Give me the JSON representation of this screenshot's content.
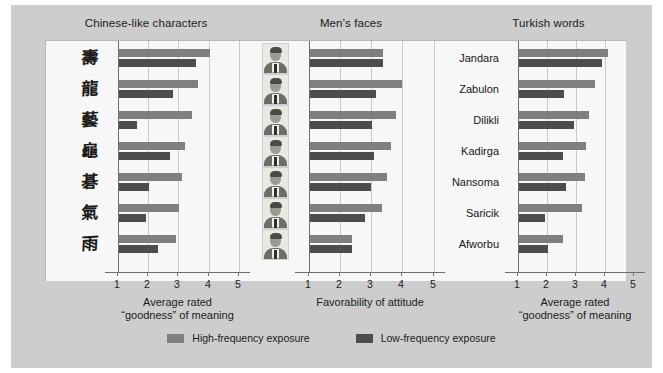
{
  "figure": {
    "background_color": "#cdcdcd",
    "plot_background_color": "#f7f7f7",
    "series_colors": {
      "high_frequency": "#7f7f7f",
      "low_frequency": "#4d4d4d"
    }
  },
  "legend": {
    "items": [
      {
        "label": "High-frequency exposure",
        "color": "#7f7f7f",
        "key": "hi"
      },
      {
        "label": "Low-frequency exposure",
        "color": "#4d4d4d",
        "key": "lo"
      }
    ]
  },
  "chart_data": [
    {
      "type": "bar",
      "orientation": "horizontal",
      "title": "Chinese-like characters",
      "xlabel": "Average rated\n“goodness” of meaning",
      "ylabel": "",
      "xlim": [
        0.6,
        5.4
      ],
      "ticks": [
        1,
        2,
        3,
        4,
        5
      ],
      "tick_labels": [
        "1",
        "2",
        "3",
        "4",
        "5"
      ],
      "grid": true,
      "categories": [
        "char-1",
        "char-2",
        "char-3",
        "char-4",
        "char-5",
        "char-6",
        "char-7"
      ],
      "category_glyphs": [
        "壽",
        "龍",
        "藝",
        "龜",
        "碁",
        "氣",
        "雨"
      ],
      "series": [
        {
          "name": "High-frequency exposure",
          "key": "hi",
          "values": [
            4.0,
            3.6,
            3.4,
            3.2,
            3.1,
            3.0,
            2.9
          ]
        },
        {
          "name": "Low-frequency exposure",
          "key": "lo",
          "values": [
            3.55,
            2.8,
            1.6,
            2.7,
            2.0,
            1.9,
            2.3
          ]
        }
      ]
    },
    {
      "type": "bar",
      "orientation": "horizontal",
      "title": "Men’s faces",
      "xlabel": "Favorability of attitude",
      "ylabel": "",
      "xlim": [
        0.6,
        5.4
      ],
      "ticks": [
        1,
        2,
        3,
        4,
        5
      ],
      "tick_labels": [
        "1",
        "2",
        "3",
        "4",
        "5"
      ],
      "grid": true,
      "categories": [
        "face-1",
        "face-2",
        "face-3",
        "face-4",
        "face-5",
        "face-6",
        "face-7"
      ],
      "series": [
        {
          "name": "High-frequency exposure",
          "key": "hi",
          "values": [
            3.35,
            3.95,
            3.75,
            3.6,
            3.45,
            3.3,
            2.35
          ]
        },
        {
          "name": "Low-frequency exposure",
          "key": "lo",
          "values": [
            3.35,
            3.1,
            3.0,
            3.05,
            2.95,
            2.75,
            2.35
          ]
        }
      ]
    },
    {
      "type": "bar",
      "orientation": "horizontal",
      "title": "Turkish words",
      "xlabel": "Average rated\n“goodness” of meaning",
      "ylabel": "",
      "xlim": [
        0.6,
        5.4
      ],
      "ticks": [
        1,
        2,
        3,
        4,
        5
      ],
      "tick_labels": [
        "1",
        "2",
        "3",
        "4",
        "5"
      ],
      "grid": true,
      "categories": [
        "Jandara",
        "Zabulon",
        "Dilikli",
        "Kadirga",
        "Nansoma",
        "Saricik",
        "Afworbu"
      ],
      "series": [
        {
          "name": "High-frequency exposure",
          "key": "hi",
          "values": [
            4.05,
            3.6,
            3.4,
            3.3,
            3.25,
            3.15,
            2.5
          ]
        },
        {
          "name": "Low-frequency exposure",
          "key": "lo",
          "values": [
            3.85,
            2.55,
            2.9,
            2.5,
            2.6,
            1.9,
            2.0
          ]
        }
      ]
    }
  ]
}
